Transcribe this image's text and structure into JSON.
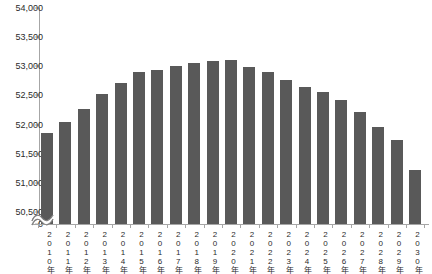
{
  "chart_data": {
    "type": "bar",
    "title": "",
    "subtitle": "",
    "xlabel": "",
    "ylabel": "",
    "categories": [
      "2010年",
      "2011年",
      "2012年",
      "2013年",
      "2014年",
      "2015年",
      "2016年",
      "2017年",
      "2018年",
      "2019年",
      "2020年",
      "2021年",
      "2022年",
      "2023年",
      "2024年",
      "2025年",
      "2026年",
      "2027年",
      "2028年",
      "2029年",
      "2030年"
    ],
    "values": [
      51850,
      52050,
      52270,
      52520,
      52720,
      52910,
      52940,
      53000,
      53060,
      53090,
      53100,
      52980,
      52900,
      52760,
      52640,
      52560,
      52430,
      52210,
      51950,
      51730,
      51220
    ],
    "ylim": [
      0,
      54000
    ],
    "yticks": [
      0,
      50500,
      51000,
      51500,
      52000,
      52500,
      53000,
      53500,
      54000
    ],
    "ytick_labels": [
      "0",
      "50,500",
      "51,000",
      "51,500",
      "52,000",
      "52,500",
      "53,000",
      "53,500",
      "54,000"
    ],
    "axis_break": true,
    "grid": false,
    "legend": null,
    "bar_color": "#595959",
    "axis_color": "#a6a6a6",
    "text_color": "#2b2b2b"
  }
}
